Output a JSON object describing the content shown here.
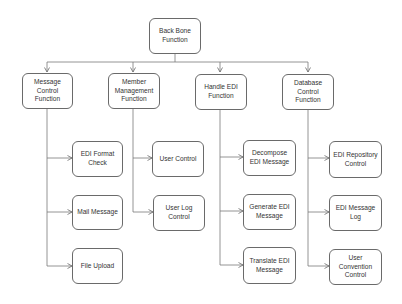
{
  "diagram": {
    "type": "hierarchy",
    "colors": {
      "stroke": "#6a6a6a",
      "text": "#333333",
      "background": "#ffffff"
    },
    "root": {
      "id": "backbone",
      "label": "Back Bone Function"
    },
    "branches": [
      {
        "id": "message-control",
        "label": "Message Control Function",
        "children": [
          {
            "id": "edi-format-check",
            "label": "EDI Format Check"
          },
          {
            "id": "mail-message",
            "label": "Mail Message"
          },
          {
            "id": "file-upload",
            "label": "File Upload"
          }
        ]
      },
      {
        "id": "member-management",
        "label": "Member Management Function",
        "children": [
          {
            "id": "user-control",
            "label": "User Control"
          },
          {
            "id": "user-log-control",
            "label": "User Log Control"
          }
        ]
      },
      {
        "id": "handle-edi",
        "label": "Handle EDI Function",
        "children": [
          {
            "id": "decompose-edi-message",
            "label": "Decompose EDI Message"
          },
          {
            "id": "generate-edi-message",
            "label": "Generate EDI Message"
          },
          {
            "id": "translate-edi-message",
            "label": "Translate EDI Message"
          }
        ]
      },
      {
        "id": "database-control",
        "label": "Database Control Function",
        "children": [
          {
            "id": "edi-repository-control",
            "label": "EDI Repository Control"
          },
          {
            "id": "edi-message-log",
            "label": "EDI Message Log"
          },
          {
            "id": "user-convention-control",
            "label": "User Convention Control"
          }
        ]
      }
    ],
    "edges": [
      [
        "backbone",
        "message-control"
      ],
      [
        "backbone",
        "member-management"
      ],
      [
        "backbone",
        "handle-edi"
      ],
      [
        "backbone",
        "database-control"
      ],
      [
        "message-control",
        "edi-format-check"
      ],
      [
        "message-control",
        "mail-message"
      ],
      [
        "message-control",
        "file-upload"
      ],
      [
        "member-management",
        "user-control"
      ],
      [
        "member-management",
        "user-log-control"
      ],
      [
        "handle-edi",
        "decompose-edi-message"
      ],
      [
        "handle-edi",
        "generate-edi-message"
      ],
      [
        "handle-edi",
        "translate-edi-message"
      ],
      [
        "database-control",
        "edi-repository-control"
      ],
      [
        "database-control",
        "edi-message-log"
      ],
      [
        "database-control",
        "user-convention-control"
      ]
    ]
  }
}
